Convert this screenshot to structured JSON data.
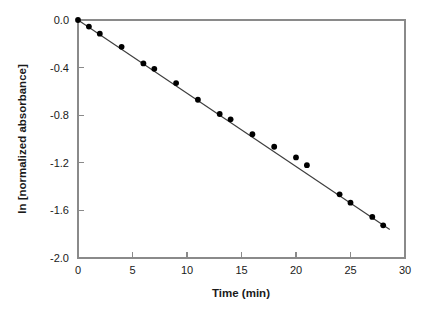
{
  "chart_data": {
    "type": "scatter",
    "title": "",
    "subtitle": "",
    "xlabel": "Time (min)",
    "ylabel": "ln [normalized absorbance]",
    "xlim": [
      0,
      30
    ],
    "ylim": [
      -2.0,
      0.0
    ],
    "xticks": [
      0,
      5,
      10,
      15,
      20,
      25,
      30
    ],
    "xtick_labels": [
      "0",
      "5",
      "10",
      "15",
      "20",
      "25",
      "30"
    ],
    "yticks": [
      0.0,
      -0.4,
      -0.8,
      -1.2,
      -1.6,
      -2.0
    ],
    "ytick_labels": [
      "0.0",
      "-0.4",
      "-0.8",
      "-1.2",
      "-1.6",
      "-2.0"
    ],
    "grid": false,
    "legend": null,
    "legend_position": "none",
    "marker_style": "filled-circle",
    "marker_color": "#000000",
    "line_color": "#3d3d3d",
    "axis_color": "#8a8a8a",
    "background_color": "#ffffff",
    "series": [
      {
        "name": "ln [normalized absorbance]",
        "type": "scatter",
        "x": [
          0,
          1,
          2,
          4,
          6,
          7,
          9,
          11,
          13,
          14,
          16,
          18,
          20,
          21,
          24,
          25,
          27,
          28
        ],
        "y": [
          0.0,
          -0.055,
          -0.115,
          -0.225,
          -0.365,
          -0.41,
          -0.53,
          -0.67,
          -0.79,
          -0.835,
          -0.96,
          -1.065,
          -1.155,
          -1.22,
          -1.465,
          -1.535,
          -1.655,
          -1.725
        ]
      },
      {
        "name": "linear fit",
        "type": "line",
        "x": [
          0,
          28.6
        ],
        "y": [
          0.0,
          -1.76
        ],
        "slope": -0.0615,
        "intercept": 0.0
      }
    ]
  },
  "figure": {
    "x_axis_title": "Time (min)",
    "y_axis_title": "ln [normalized absorbance]"
  }
}
